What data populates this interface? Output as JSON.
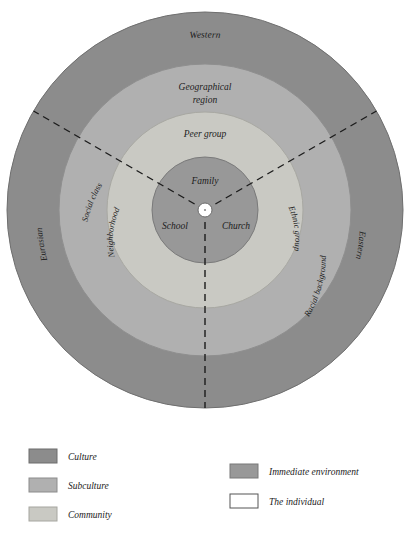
{
  "diagram": {
    "title_present": false,
    "center": {
      "cx": 205,
      "cy": 210
    },
    "rings": [
      {
        "key": "culture",
        "name": "Culture",
        "color": "#8c8c8c",
        "outer_r": 198,
        "inner_r": 146,
        "labels": [
          {
            "text": "Western",
            "position": "top"
          },
          {
            "text": "Eurasian",
            "position": "lower-left"
          },
          {
            "text": "Eastern",
            "position": "lower-right"
          }
        ]
      },
      {
        "key": "subculture",
        "name": "Subculture",
        "color": "#b0b0b0",
        "outer_r": 146,
        "inner_r": 98,
        "labels": [
          {
            "text": "Geographical",
            "position": "top-line1"
          },
          {
            "text": "region",
            "position": "top-line2"
          },
          {
            "text": "Racial background",
            "position": "lower-right"
          }
        ]
      },
      {
        "key": "community",
        "name": "Community",
        "color": "#c9c9c3",
        "outer_r": 98,
        "inner_r": 53,
        "labels": [
          {
            "text": "Peer group",
            "position": "top"
          },
          {
            "text": "Neighborhood",
            "position": "lower-left"
          },
          {
            "text": "Ethnic group",
            "position": "lower-right"
          },
          {
            "text": "Social class",
            "position": "left-outer"
          }
        ]
      },
      {
        "key": "immediate-environment",
        "name": "Immediate environment",
        "color": "#989898",
        "outer_r": 53,
        "inner_r": 7,
        "labels": [
          {
            "text": "Family",
            "position": "top"
          },
          {
            "text": "School",
            "position": "bottom-left"
          },
          {
            "text": "Church",
            "position": "bottom-right"
          }
        ]
      },
      {
        "key": "the-individual",
        "name": "The individual",
        "color": "#ffffff",
        "outer_r": 7,
        "inner_r": 0,
        "labels": []
      }
    ],
    "dividers": {
      "style": "dashed",
      "color": "#1c1c1c",
      "angles_deg": [
        90,
        210,
        330
      ],
      "note": "three dashed radial lines from the centre to the outer edge"
    }
  },
  "legend": {
    "left_column": [
      {
        "label": "Culture",
        "color": "#8c8c8c",
        "border": "#6d6d6d"
      },
      {
        "label": "Subculture",
        "color": "#b0b0b0",
        "border": "#8c8c8c"
      },
      {
        "label": "Community",
        "color": "#c9c9c3",
        "border": "#a6a6a0"
      }
    ],
    "right_column": [
      {
        "label": "Immediate environment",
        "color": "#989898",
        "border": "#787878"
      },
      {
        "label": "The individual",
        "color": "#ffffff",
        "border": "#555555"
      }
    ]
  }
}
